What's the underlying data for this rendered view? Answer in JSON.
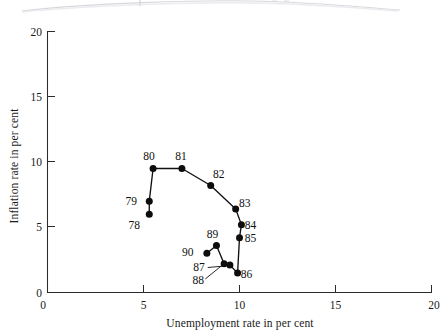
{
  "chart_data": {
    "type": "scatter",
    "title": "",
    "xlabel": "Unemployment rate in per cent",
    "ylabel": "Inflation rate in per cent",
    "xlim": [
      0,
      20
    ],
    "ylim": [
      0,
      20
    ],
    "xticks": [
      "0",
      "5",
      "10",
      "15",
      "20"
    ],
    "xtick_values": [
      0,
      5,
      10,
      15,
      20
    ],
    "yticks": [
      "0",
      "5",
      "10",
      "15",
      "20"
    ],
    "ytick_values": [
      0,
      5,
      10,
      15,
      20
    ],
    "grid": false,
    "legend": "none",
    "connected": true,
    "series": [
      {
        "name": "Phillips curve loop",
        "points": [
          {
            "label": "78",
            "x": 5.3,
            "y": 6.0,
            "label_dx": -15,
            "label_dy": 15,
            "leader": false
          },
          {
            "label": "79",
            "x": 5.3,
            "y": 7.0,
            "label_dx": -18,
            "label_dy": 4,
            "leader": false
          },
          {
            "label": "80",
            "x": 5.5,
            "y": 9.5,
            "label_dx": -4,
            "label_dy": -9,
            "leader": false
          },
          {
            "label": "81",
            "x": 7.0,
            "y": 9.5,
            "label_dx": -1,
            "label_dy": -9,
            "leader": false
          },
          {
            "label": "82",
            "x": 8.5,
            "y": 8.2,
            "label_dx": 8,
            "label_dy": -7,
            "leader": false
          },
          {
            "label": "83",
            "x": 9.8,
            "y": 6.4,
            "label_dx": 9,
            "label_dy": -2,
            "leader": false
          },
          {
            "label": "84",
            "x": 10.1,
            "y": 5.2,
            "label_dx": 9,
            "label_dy": 4,
            "leader": false
          },
          {
            "label": "85",
            "x": 10.0,
            "y": 4.2,
            "label_dx": 11,
            "label_dy": 4,
            "leader": false
          },
          {
            "label": "86",
            "x": 9.9,
            "y": 1.5,
            "label_dx": 9,
            "label_dy": 5,
            "leader": false
          },
          {
            "label": "87",
            "x": 9.5,
            "y": 2.1,
            "label_dx": -31,
            "label_dy": 6,
            "leader": true
          },
          {
            "label": "88",
            "x": 9.2,
            "y": 2.2,
            "label_dx": -26,
            "label_dy": 20,
            "leader": true
          },
          {
            "label": "89",
            "x": 8.8,
            "y": 3.6,
            "label_dx": -4,
            "label_dy": -8,
            "leader": false
          },
          {
            "label": "90",
            "x": 8.3,
            "y": 3.0,
            "label_dx": -19,
            "label_dy": 3,
            "leader": false
          }
        ]
      }
    ],
    "colors": {
      "marker": "#0d0d0d",
      "line": "#111111",
      "axis": "#2b2b2b",
      "background": "#ffffff"
    }
  }
}
